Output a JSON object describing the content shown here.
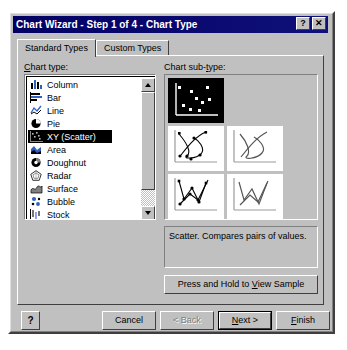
{
  "window": {
    "title": "Chart Wizard - Step 1 of 4 - Chart Type",
    "help_button": "?",
    "close_button": "✕"
  },
  "tabs": [
    {
      "label": "Standard Types",
      "active": true
    },
    {
      "label": "Custom Types",
      "active": false
    }
  ],
  "chart_type": {
    "label": "Chart type:",
    "label_accel": "C",
    "selected": "XY (Scatter)",
    "items": [
      {
        "label": "Column",
        "icon": "column-chart-icon"
      },
      {
        "label": "Bar",
        "icon": "bar-chart-icon"
      },
      {
        "label": "Line",
        "icon": "line-chart-icon"
      },
      {
        "label": "Pie",
        "icon": "pie-chart-icon"
      },
      {
        "label": "XY (Scatter)",
        "icon": "scatter-chart-icon"
      },
      {
        "label": "Area",
        "icon": "area-chart-icon"
      },
      {
        "label": "Doughnut",
        "icon": "doughnut-chart-icon"
      },
      {
        "label": "Radar",
        "icon": "radar-chart-icon"
      },
      {
        "label": "Surface",
        "icon": "surface-chart-icon"
      },
      {
        "label": "Bubble",
        "icon": "bubble-chart-icon"
      },
      {
        "label": "Stock",
        "icon": "stock-chart-icon"
      }
    ]
  },
  "chart_subtype": {
    "label": "Chart sub-type:",
    "label_accel": "t",
    "selected_index": 0,
    "items": [
      {
        "name": "scatter-markers-only"
      },
      {
        "name": "scatter-smooth-lines-with-markers"
      },
      {
        "name": "scatter-smooth-lines-no-markers"
      },
      {
        "name": "scatter-straight-lines-with-markers"
      },
      {
        "name": "scatter-straight-lines-no-markers"
      }
    ]
  },
  "description": "Scatter. Compares pairs of values.",
  "sample_button": {
    "prefix": "Press and Hold to ",
    "accel": "V",
    "suffix": "iew Sample"
  },
  "buttons": {
    "help": "?",
    "cancel": "Cancel",
    "back": "< Back",
    "next_prefix": "",
    "next_accel": "N",
    "next_suffix": "ext >",
    "finish_accel": "F",
    "finish_suffix": "inish"
  },
  "colors": {
    "titlebar": "#000064",
    "dialog_face": "#c0c0c0",
    "selection": "#000000",
    "list_background": "#ffffff"
  }
}
